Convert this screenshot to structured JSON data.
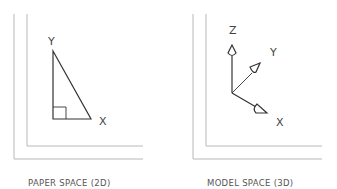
{
  "panels": [
    {
      "caption": "PAPER SPACE (2D)",
      "axes": {
        "y": "Y",
        "x": "X"
      }
    },
    {
      "caption": "MODEL SPACE (3D)",
      "axes": {
        "z": "Z",
        "y": "Y",
        "x": "X"
      }
    }
  ],
  "colors": {
    "frame": "#b8b8b8",
    "stroke": "#333333",
    "text": "#555555"
  }
}
